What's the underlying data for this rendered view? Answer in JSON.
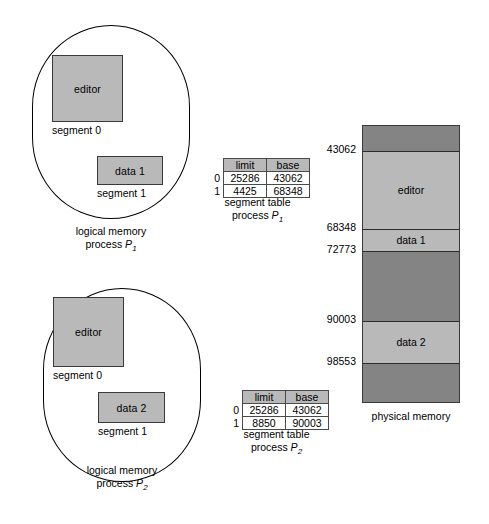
{
  "logical_memories": [
    {
      "id": "p1",
      "caption_line1": "logical memory",
      "caption_line2_prefix": "process ",
      "caption_line2_var": "P",
      "caption_line2_sub": "1",
      "segments": [
        {
          "name": "editor",
          "label": "segment 0"
        },
        {
          "name": "data 1",
          "label": "segment 1"
        }
      ]
    },
    {
      "id": "p2",
      "caption_line1": "logical memory",
      "caption_line2_prefix": "process ",
      "caption_line2_var": "P",
      "caption_line2_sub": "2",
      "segments": [
        {
          "name": "editor",
          "label": "segment 0"
        },
        {
          "name": "data 2",
          "label": "segment 1"
        }
      ]
    }
  ],
  "segment_tables": [
    {
      "id": "table_p1",
      "headers": [
        "limit",
        "base"
      ],
      "rows": [
        {
          "index": "0",
          "limit": "25286",
          "base": "43062"
        },
        {
          "index": "1",
          "limit": "4425",
          "base": "68348"
        }
      ],
      "caption_line1": "segment table",
      "caption_line2_prefix": "process ",
      "caption_line2_var": "P",
      "caption_line2_sub": "1"
    },
    {
      "id": "table_p2",
      "headers": [
        "limit",
        "base"
      ],
      "rows": [
        {
          "index": "0",
          "limit": "25286",
          "base": "43062"
        },
        {
          "index": "1",
          "limit": "8850",
          "base": "90003"
        }
      ],
      "caption_line1": "segment table",
      "caption_line2_prefix": "process ",
      "caption_line2_var": "P",
      "caption_line2_sub": "2"
    }
  ],
  "physical_memory": {
    "caption": "physical memory",
    "addresses": [
      "43062",
      "68348",
      "72773",
      "90003",
      "98553"
    ],
    "bands": [
      {
        "label": "",
        "kind": "free"
      },
      {
        "label": "editor",
        "kind": "used"
      },
      {
        "label": "data 1",
        "kind": "used"
      },
      {
        "label": "",
        "kind": "free"
      },
      {
        "label": "data 2",
        "kind": "used"
      },
      {
        "label": "",
        "kind": "free"
      }
    ]
  },
  "colors": {
    "segment_fill": "#b9b9b9",
    "free_fill": "#848484",
    "stroke": "#3a3a3a",
    "background": "#ffffff"
  }
}
